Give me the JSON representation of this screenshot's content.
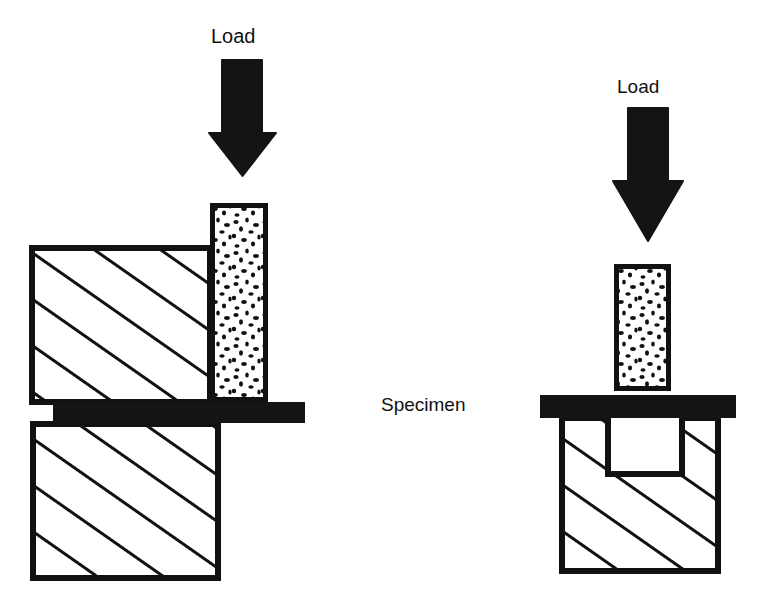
{
  "figure": {
    "title_present": false,
    "background_color": "#ffffff",
    "ink_color": "#111111",
    "fill_color": "#ffffff"
  },
  "labels": {
    "load_left": "Load",
    "load_right": "Load",
    "specimen": "Specimen"
  },
  "left_assembly": {
    "name": "offset-shear-test-setup",
    "arrow": {
      "name": "load-arrow-left",
      "direction": "down",
      "shaft_x": 222,
      "shaft_width": 40,
      "shaft_top": 60,
      "shaft_bottom": 130,
      "head_left": 209,
      "head_right": 276,
      "head_tip_y": 176
    },
    "specimen": {
      "name": "specimen-column-left",
      "x": 210,
      "y": 203,
      "width": 58,
      "height": 199,
      "fill": "speckled",
      "border_px": 5
    },
    "upper_block": {
      "name": "upper-fixture-block-left",
      "x": 32,
      "y": 248,
      "width": 178,
      "height": 154,
      "hatch": "diagonal"
    },
    "lower_block": {
      "name": "lower-fixture-block-left",
      "x": 33,
      "y": 424,
      "width": 185,
      "height": 154,
      "hatch": "diagonal"
    },
    "load_plate": {
      "name": "load-plate-left",
      "x": 53,
      "y": 402,
      "width": 252,
      "height": 21,
      "fill": "#141414"
    }
  },
  "right_assembly": {
    "name": "punch-shear-test-setup",
    "arrow": {
      "name": "load-arrow-right",
      "direction": "down",
      "shaft_x": 628,
      "shaft_width": 40,
      "shaft_top": 108,
      "shaft_bottom": 178,
      "head_left": 613,
      "head_right": 683,
      "head_tip_y": 241
    },
    "specimen": {
      "name": "specimen-column-right",
      "x": 614,
      "y": 264,
      "width": 57,
      "height": 127,
      "fill": "speckled",
      "border_px": 5
    },
    "load_plate": {
      "name": "load-plate-right",
      "x": 540,
      "y": 395,
      "width": 196,
      "height": 23,
      "fill": "#141414"
    },
    "block": {
      "name": "fixture-block-right",
      "x": 562,
      "y": 418,
      "width": 156,
      "height": 153,
      "hatch": "diagonal"
    },
    "cavity": {
      "name": "block-cavity-right",
      "x": 608,
      "y": 418,
      "width": 74,
      "height": 56,
      "fill": "#ffffff"
    }
  }
}
